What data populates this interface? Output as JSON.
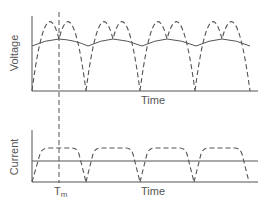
{
  "diagram": {
    "colors": {
      "line": "#555555",
      "background": "#ffffff"
    },
    "voltage_plot": {
      "ylabel": "Voltage",
      "xlabel": "Time",
      "series": [
        {
          "name": "rectified-voltage",
          "style": "dashed",
          "shape": "full-wave rectified sine, 4 humps"
        },
        {
          "name": "smoothed-voltage",
          "style": "solid",
          "shape": "ripple following peaks"
        }
      ]
    },
    "current_plot": {
      "ylabel": "Current",
      "xlabel": "Time",
      "series": [
        {
          "name": "pulsed-current",
          "style": "dashed",
          "shape": "trapezoidal pulses, 4 plateaus"
        },
        {
          "name": "average-current",
          "style": "solid",
          "shape": "constant horizontal line"
        }
      ]
    },
    "marker": {
      "label": "T",
      "subscript": "m",
      "style": "dashed vertical line at first voltage peak"
    }
  }
}
